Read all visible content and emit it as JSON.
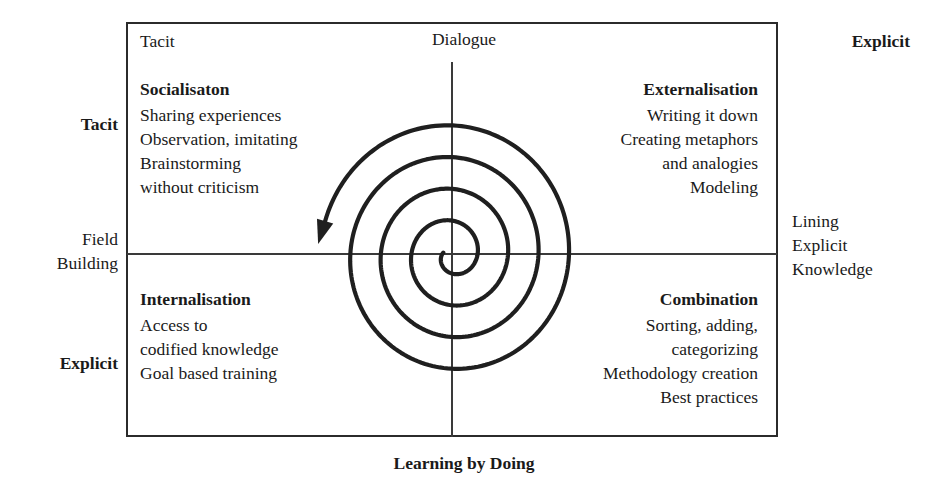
{
  "diagram": {
    "axes": {
      "top_label": "Dialogue",
      "bottom_label": "Learning by Doing",
      "left_top_label": "Tacit",
      "left_middle_label": "Field\nBuilding",
      "left_middle_line1": "Field",
      "left_middle_line2": "Building",
      "left_bottom_label": "Explicit",
      "right_label_line1": "Lining",
      "right_label_line2": "Explicit",
      "right_label_line3": "Knowledge"
    },
    "corner_labels": {
      "top_left": "Tacit",
      "top_right": "Explicit"
    },
    "quadrants": {
      "top_left": {
        "title": "Socialisaton",
        "lines": [
          "Sharing experiences",
          "Observation, imitating",
          "Brainstorming",
          "without criticism"
        ]
      },
      "top_right": {
        "title": "Externalisation",
        "lines": [
          "Writing it down",
          "Creating metaphors",
          "and analogies",
          "Modeling"
        ]
      },
      "bottom_left": {
        "title": "Internalisation",
        "lines": [
          "Access to",
          "codified knowledge",
          "Goal based training"
        ]
      },
      "bottom_right": {
        "title": "Combination",
        "lines": [
          "Sorting, adding,",
          "categorizing",
          "Methodology creation",
          "Best practices"
        ]
      }
    },
    "spiral": {
      "description": "counterclockwise outward spiral with arrowhead",
      "turns": 4,
      "center_x": 452,
      "center_y": 255,
      "arrow_direction": "up-left"
    },
    "colors": {
      "ink": "#1a1a1a",
      "line": "#2b2b2b",
      "background": "#ffffff"
    }
  }
}
